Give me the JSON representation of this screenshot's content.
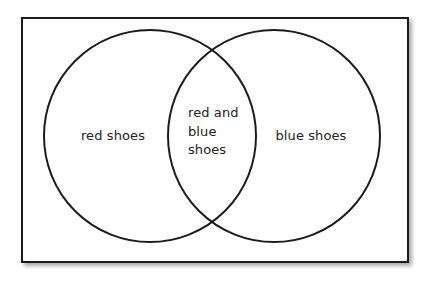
{
  "figure": {
    "kind": "venn-diagram",
    "sets_count": 2,
    "frame": {
      "label": "universal-set-rectangle",
      "x": 22,
      "y": 18,
      "width": 386,
      "height": 244,
      "stroke_color": "#1c1c1c",
      "stroke_width": 2,
      "fill_color": "#ffffff",
      "shadow_color": "#b4b4b4"
    },
    "background_color": "#ffffff",
    "text_color": "#232323",
    "circles": [
      {
        "name": "left-circle",
        "cx": 150,
        "cy": 136,
        "r": 106,
        "stroke_color": "#1c1c1c",
        "stroke_width": 2,
        "fill": "none"
      },
      {
        "name": "right-circle",
        "cx": 274,
        "cy": 136,
        "r": 106,
        "stroke_color": "#1c1c1c",
        "stroke_width": 2,
        "fill": "none"
      }
    ],
    "regions": {
      "left_only": "red shoes",
      "intersection_line1": "red and",
      "intersection_line2": "blue",
      "intersection_line3": "shoes",
      "right_only": "blue shoes"
    }
  }
}
